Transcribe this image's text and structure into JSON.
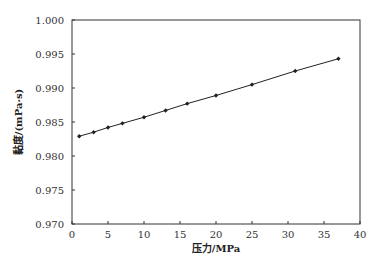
{
  "chart_data": {
    "type": "line",
    "title": "",
    "xlabel": "压力/MPa",
    "ylabel": "黏度/(mPa·s)",
    "xlim": [
      0,
      40
    ],
    "ylim": [
      0.97,
      1.0
    ],
    "xticks": [
      "0",
      "5",
      "10",
      "15",
      "20",
      "25",
      "30",
      "35",
      "40"
    ],
    "yticks": [
      "0.970",
      "0.975",
      "0.980",
      "0.985",
      "0.990",
      "0.995",
      "1.000"
    ],
    "grid": false,
    "legend": null,
    "series": [
      {
        "name": "黏度",
        "marker": "diamond",
        "color": "#222222",
        "x": [
          1.0,
          3.0,
          5.0,
          7.0,
          10.0,
          13.0,
          16.0,
          20.0,
          25.0,
          31.0,
          37.0
        ],
        "y": [
          0.9829,
          0.9835,
          0.9842,
          0.9848,
          0.9857,
          0.9867,
          0.9877,
          0.9889,
          0.9905,
          0.9925,
          0.9943
        ]
      }
    ]
  },
  "labels": {
    "x_axis": "压力/MPa",
    "y_axis": "黏度/(mPa·s)"
  }
}
